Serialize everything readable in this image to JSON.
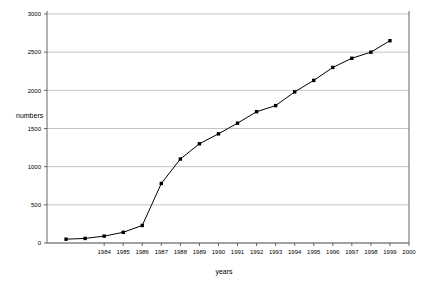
{
  "chart_data": {
    "type": "line",
    "title": "",
    "xlabel": "years",
    "ylabel": "numbers",
    "x": [
      1982,
      1983,
      1984,
      1985,
      1986,
      1987,
      1988,
      1989,
      1990,
      1991,
      1992,
      1993,
      1994,
      1995,
      1996,
      1997,
      1998,
      1999
    ],
    "values": [
      50,
      60,
      90,
      140,
      230,
      780,
      1100,
      1300,
      1430,
      1570,
      1720,
      1800,
      1980,
      2130,
      2300,
      2420,
      2500,
      2650
    ],
    "series": [
      {
        "name": "numbers",
        "values": [
          50,
          60,
          90,
          140,
          230,
          780,
          1100,
          1300,
          1430,
          1570,
          1720,
          1800,
          1980,
          2130,
          2300,
          2420,
          2500,
          2650
        ]
      }
    ],
    "xlim": [
      1981,
      2000
    ],
    "ylim": [
      0,
      3000
    ],
    "ytick_labels": [
      "0",
      "500",
      "1000",
      "1500",
      "2000",
      "2500",
      "3000"
    ],
    "ytick_values": [
      0,
      500,
      1000,
      1500,
      2000,
      2500,
      3000
    ],
    "xtick_labels": [
      "1984",
      "1985",
      "1986",
      "1987",
      "1988",
      "1989",
      "1990",
      "1991",
      "1992",
      "1993",
      "1994",
      "1995",
      "1996",
      "1997",
      "1998",
      "1999",
      "2000"
    ],
    "xtick_values": [
      1984,
      1985,
      1986,
      1987,
      1988,
      1989,
      1990,
      1991,
      1992,
      1993,
      1994,
      1995,
      1996,
      1997,
      1998,
      1999,
      2000
    ],
    "grid": "horizontal",
    "legend": "none",
    "line_color": "#000000",
    "marker_color": "#000000",
    "grid_color": "#aaaaaa",
    "axis_color": "#555555",
    "background": "#ffffff"
  }
}
